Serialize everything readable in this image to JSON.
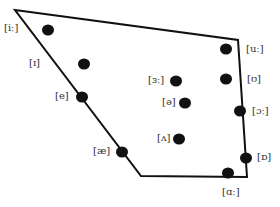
{
  "diagram": {
    "type": "vowel-quadrilateral",
    "outline": {
      "color": "#111111",
      "points": [
        [
          15,
          10
        ],
        [
          238,
          40
        ],
        [
          247,
          177
        ],
        [
          141,
          176
        ]
      ]
    },
    "dot_color": "#111111",
    "vowels": [
      {
        "symbol": "[iː]",
        "dot": [
          48,
          30
        ],
        "label": [
          4,
          23
        ]
      },
      {
        "symbol": "[ɪ]",
        "dot": [
          84,
          64
        ],
        "label": [
          29,
          58
        ]
      },
      {
        "symbol": "[e]",
        "dot": [
          82,
          97
        ],
        "label": [
          55,
          91
        ]
      },
      {
        "symbol": "[æ]",
        "dot": [
          122,
          152
        ],
        "label": [
          93,
          146
        ]
      },
      {
        "symbol": "[ɜː]",
        "dot": [
          176,
          81
        ],
        "label": [
          148,
          75
        ]
      },
      {
        "symbol": "[ə]",
        "dot": [
          185,
          103
        ],
        "label": [
          162,
          97
        ]
      },
      {
        "symbol": "[ʌ]",
        "dot": [
          179,
          139
        ],
        "label": [
          157,
          133
        ]
      },
      {
        "symbol": "[uː]",
        "dot": [
          226,
          49
        ],
        "label": [
          246,
          44
        ]
      },
      {
        "symbol": "[ʊ]",
        "dot": [
          226,
          79
        ],
        "label": [
          247,
          74
        ]
      },
      {
        "symbol": "[ɔː]",
        "dot": [
          240,
          111
        ],
        "label": [
          252,
          106
        ]
      },
      {
        "symbol": "[ɒ]",
        "dot": [
          246,
          158
        ],
        "label": [
          257,
          152
        ]
      },
      {
        "symbol": "[ɑː]",
        "dot": [
          228,
          173
        ],
        "label": [
          222,
          187
        ]
      }
    ]
  }
}
